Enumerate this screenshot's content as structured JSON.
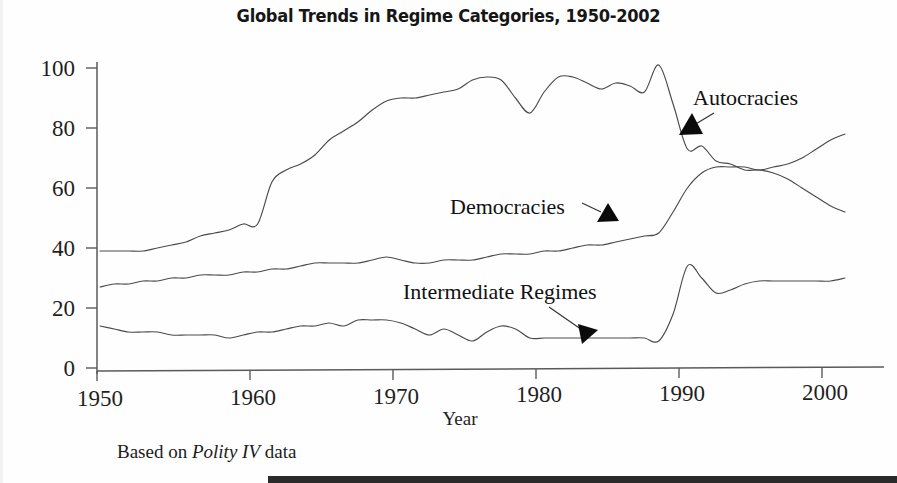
{
  "figure": {
    "title": "Global Trends in Regime Categories, 1950-2002",
    "source_note_prefix": "Based on ",
    "source_note_italic": "Polity IV",
    "source_note_suffix": " data"
  },
  "axes": {
    "x_name": "Year",
    "x_ticks": [
      "1950",
      "1960",
      "1970",
      "1980",
      "1990",
      "2000"
    ],
    "y_ticks": [
      "0",
      "20",
      "40",
      "60",
      "80",
      "100"
    ]
  },
  "annotations": {
    "autocracies": "Autocracies",
    "democracies": "Democracies",
    "intermediate": "Intermediate Regimes"
  },
  "colors": {
    "line": "#4a4a4a",
    "axis": "#5a5a5a",
    "text": "#1a1a1a",
    "pointer": "#0b0b0b",
    "background": "#ffffff"
  },
  "chart_data": {
    "type": "line",
    "title": "Global Trends in Regime Categories, 1950-2002",
    "xlabel": "Year",
    "ylabel": "",
    "xlim": [
      1950,
      2002
    ],
    "ylim": [
      0,
      105
    ],
    "xticks": [
      1950,
      1960,
      1970,
      1980,
      1990,
      2000
    ],
    "yticks": [
      0,
      20,
      40,
      60,
      80,
      100
    ],
    "grid": false,
    "legend": "inline-annotations",
    "source": "Based on Polity IV data",
    "x": [
      1950,
      1951,
      1952,
      1953,
      1954,
      1955,
      1956,
      1957,
      1958,
      1959,
      1960,
      1961,
      1962,
      1963,
      1964,
      1965,
      1966,
      1967,
      1968,
      1969,
      1970,
      1971,
      1972,
      1973,
      1974,
      1975,
      1976,
      1977,
      1978,
      1979,
      1980,
      1981,
      1982,
      1983,
      1984,
      1985,
      1986,
      1987,
      1988,
      1989,
      1990,
      1991,
      1992,
      1993,
      1994,
      1995,
      1996,
      1997,
      1998,
      1999,
      2000,
      2001,
      2002
    ],
    "series": [
      {
        "name": "Autocracies",
        "values": [
          39,
          39,
          39,
          39,
          40,
          41,
          42,
          44,
          45,
          46,
          48,
          48,
          62,
          66,
          68,
          71,
          76,
          79,
          82,
          86,
          89,
          90,
          90,
          91,
          92,
          93,
          96,
          97,
          96,
          90,
          85,
          92,
          97,
          97,
          95,
          93,
          95,
          94,
          92,
          101,
          88,
          73,
          74,
          69,
          68,
          66,
          66,
          65,
          63,
          60,
          57,
          54,
          52
        ]
      },
      {
        "name": "Democracies",
        "values": [
          27,
          28,
          28,
          29,
          29,
          30,
          30,
          31,
          31,
          31,
          32,
          32,
          33,
          33,
          34,
          35,
          35,
          35,
          35,
          36,
          37,
          36,
          35,
          35,
          36,
          36,
          36,
          37,
          38,
          38,
          38,
          39,
          39,
          40,
          41,
          41,
          42,
          43,
          44,
          45,
          52,
          60,
          65,
          67,
          67,
          67,
          66,
          67,
          68,
          70,
          73,
          76,
          78
        ]
      },
      {
        "name": "Intermediate Regimes",
        "values": [
          14,
          13,
          12,
          12,
          12,
          11,
          11,
          11,
          11,
          10,
          11,
          12,
          12,
          13,
          14,
          14,
          15,
          14,
          16,
          16,
          16,
          15,
          13,
          11,
          13,
          11,
          9,
          12,
          14,
          13,
          10,
          10,
          10,
          10,
          10,
          10,
          10,
          10,
          10,
          9,
          18,
          34,
          30,
          25,
          26,
          28,
          29,
          29,
          29,
          29,
          29,
          29,
          30
        ]
      }
    ]
  }
}
